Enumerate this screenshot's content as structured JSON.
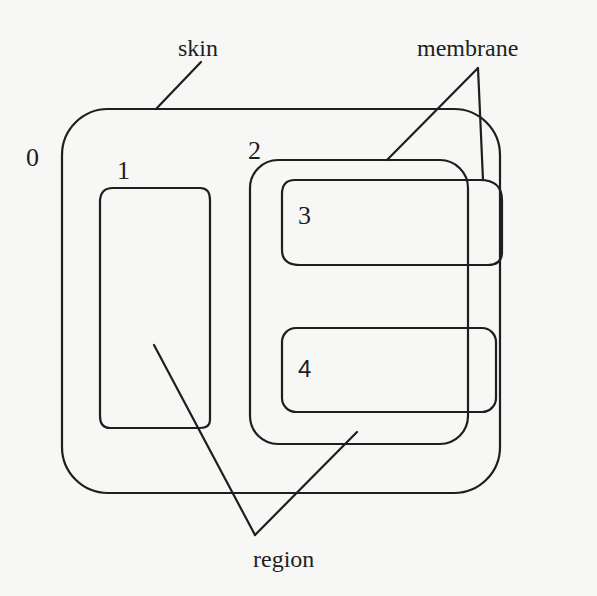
{
  "diagram": {
    "type": "nested-regions",
    "stroke_color": "#1e1e1e",
    "background_color": "#f7f7f5",
    "labels": {
      "skin": "skin",
      "membrane": "membrane",
      "region": "region"
    },
    "regions": [
      {
        "id": "0",
        "label": "0",
        "description": "outer region (outside skin)"
      },
      {
        "id": "1",
        "label": "1",
        "description": "region inside skin"
      },
      {
        "id": "2",
        "label": "2",
        "description": "region enclosed by membrane"
      },
      {
        "id": "3",
        "label": "3",
        "description": "inner region within 2 (top)"
      },
      {
        "id": "4",
        "label": "4",
        "description": "inner region within 2 (bottom)"
      }
    ],
    "pointers": [
      {
        "from": "skin",
        "to": [
          "skin boundary"
        ]
      },
      {
        "from": "membrane",
        "to": [
          "membrane of region 2",
          "membrane of region 3"
        ]
      },
      {
        "from": "region",
        "to": [
          "region 1",
          "region 2"
        ]
      }
    ]
  }
}
